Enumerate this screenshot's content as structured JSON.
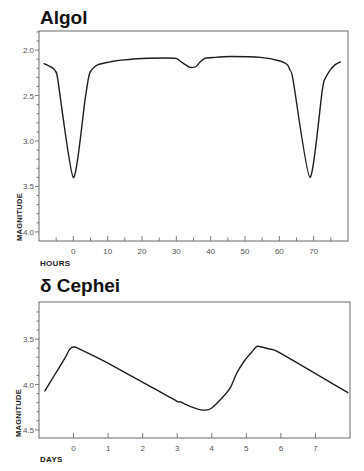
{
  "colors": {
    "curve": "#1e1e1e",
    "frame": "#6b6b6b",
    "tick_label": "#555555",
    "title": "#111111",
    "background": "#ffffff"
  },
  "chart_data": [
    {
      "type": "line",
      "title": "Algol",
      "xlabel": "HOURS",
      "ylabel": "MAGNITUDE",
      "xlim": [
        -10,
        80
      ],
      "ylim": [
        1.79,
        4.1
      ],
      "y_inverted": true,
      "grid": false,
      "legend": null,
      "xticks": [
        0,
        10,
        20,
        30,
        40,
        50,
        60,
        70
      ],
      "xtick_labels": [
        "0",
        "10",
        "20",
        "30",
        "40",
        "50",
        "60",
        "70"
      ],
      "xminor": [
        -5,
        5,
        15,
        25,
        35,
        45,
        55,
        65,
        75
      ],
      "yticks": [
        2.0,
        2.5,
        3.0,
        3.5,
        4.0
      ],
      "ytick_labels": [
        "2.0",
        "2.5",
        "3.0",
        "3.5",
        "4.0"
      ],
      "yminor": [
        1.8,
        1.9,
        2.1,
        2.2,
        2.3,
        2.4,
        2.6,
        2.7,
        2.8,
        2.9,
        3.1,
        3.2,
        3.3,
        3.4,
        3.6,
        3.7,
        3.8,
        3.9
      ],
      "series": [
        {
          "name": "Algol light curve",
          "x": [
            -8.5,
            -6.8,
            -5.6,
            -5.0,
            -4.5,
            0.0,
            3.4,
            4.3,
            4.9,
            6.0,
            7.2,
            10.7,
            13.9,
            21.8,
            29.6,
            31.1,
            32.6,
            34.0,
            35.8,
            36.9,
            38.4,
            41.4,
            45.7,
            54.5,
            60.2,
            62.3,
            63.1,
            64.0,
            68.9,
            72.5,
            73.4,
            74.8,
            76.3,
            77.8
          ],
          "y": [
            2.15,
            2.18,
            2.21,
            2.25,
            2.33,
            3.4,
            2.55,
            2.33,
            2.24,
            2.19,
            2.16,
            2.13,
            2.11,
            2.09,
            2.09,
            2.12,
            2.16,
            2.19,
            2.18,
            2.13,
            2.09,
            2.08,
            2.07,
            2.08,
            2.12,
            2.16,
            2.22,
            2.33,
            3.4,
            2.44,
            2.31,
            2.22,
            2.16,
            2.13
          ]
        }
      ]
    },
    {
      "type": "line",
      "title": "δ Cephei",
      "xlabel": "DAYS",
      "ylabel": "MAGNITUDE",
      "xlim": [
        -1,
        8
      ],
      "ylim": [
        3.09,
        4.59
      ],
      "y_inverted": true,
      "grid": false,
      "legend": null,
      "xticks": [
        0,
        1,
        2,
        3,
        4,
        5,
        6,
        7
      ],
      "xtick_labels": [
        "0",
        "1",
        "2",
        "3",
        "4",
        "5",
        "6",
        "7"
      ],
      "xminor": [],
      "yticks": [
        3.5,
        4.0,
        4.5
      ],
      "ytick_labels": [
        "3.5",
        "4.0",
        "4.5"
      ],
      "yminor": [
        3.2,
        3.3,
        3.4,
        3.6,
        3.7,
        3.8,
        3.9,
        4.1,
        4.2,
        4.3,
        4.4
      ],
      "series": [
        {
          "name": "Delta Cephei light curve",
          "x": [
            -0.83,
            -0.54,
            -0.25,
            -0.13,
            -0.05,
            0.07,
            0.24,
            0.97,
            1.98,
            2.97,
            3.08,
            3.37,
            3.69,
            3.95,
            4.24,
            4.53,
            4.73,
            4.96,
            5.16,
            5.31,
            5.48,
            5.68,
            5.97,
            7.94
          ],
          "y": [
            4.07,
            3.89,
            3.71,
            3.62,
            3.59,
            3.59,
            3.62,
            3.76,
            3.97,
            4.18,
            4.19,
            4.24,
            4.28,
            4.27,
            4.17,
            4.04,
            3.87,
            3.73,
            3.64,
            3.58,
            3.59,
            3.61,
            3.65,
            4.09
          ]
        }
      ]
    }
  ]
}
